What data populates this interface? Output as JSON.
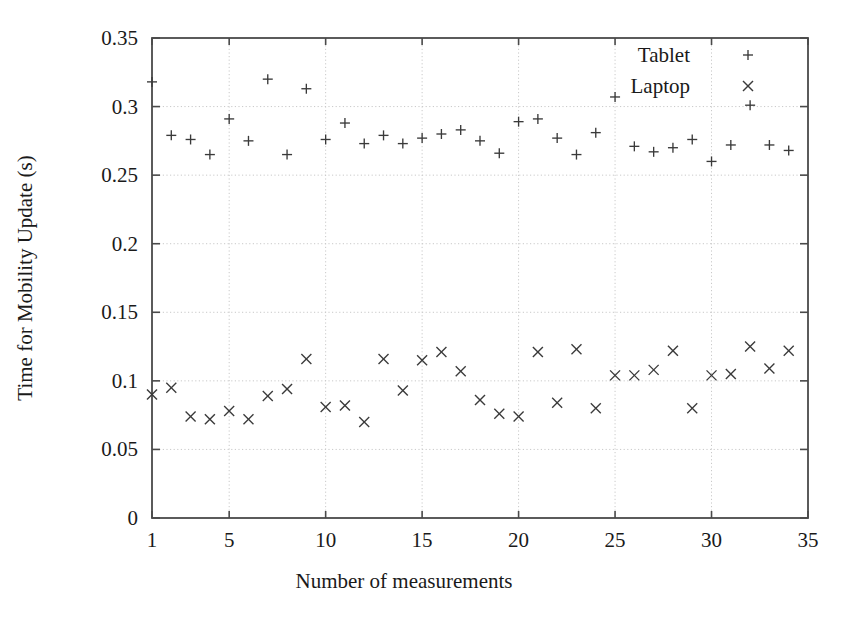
{
  "chart_data": {
    "type": "scatter",
    "title": "",
    "xlabel": "Number of measurements",
    "ylabel": "Time for Mobility Update (s)",
    "xlim": [
      1,
      35
    ],
    "ylim": [
      0,
      0.35
    ],
    "xticks": [
      1,
      5,
      10,
      15,
      20,
      25,
      30,
      35
    ],
    "xtick_labels": [
      "1",
      "5",
      "10",
      "15",
      "20",
      "25",
      "30",
      "35"
    ],
    "yticks": [
      0,
      0.05,
      0.1,
      0.15,
      0.2,
      0.25,
      0.3,
      0.35
    ],
    "ytick_labels": [
      "0",
      "0.05",
      "0.1",
      "0.15",
      "0.2",
      "0.25",
      "0.3",
      "0.35"
    ],
    "grid": true,
    "legend_position": "top-right",
    "series": [
      {
        "name": "Tablet",
        "marker": "plus",
        "color": "#3a3a3a",
        "x": [
          1,
          2,
          3,
          4,
          5,
          6,
          7,
          8,
          9,
          10,
          11,
          12,
          13,
          14,
          15,
          16,
          17,
          18,
          19,
          20,
          21,
          22,
          23,
          24,
          25,
          26,
          27,
          28,
          29,
          30,
          31,
          32,
          33,
          34
        ],
        "values": [
          0.318,
          0.279,
          0.276,
          0.265,
          0.291,
          0.275,
          0.32,
          0.265,
          0.313,
          0.276,
          0.288,
          0.273,
          0.279,
          0.273,
          0.277,
          0.28,
          0.283,
          0.275,
          0.266,
          0.289,
          0.291,
          0.277,
          0.265,
          0.281,
          0.307,
          0.271,
          0.267,
          0.27,
          0.276,
          0.26,
          0.272,
          0.301,
          0.272,
          0.268
        ]
      },
      {
        "name": "Laptop",
        "marker": "cross",
        "color": "#3a3a3a",
        "x": [
          1,
          2,
          3,
          4,
          5,
          6,
          7,
          8,
          9,
          10,
          11,
          12,
          13,
          14,
          15,
          16,
          17,
          18,
          19,
          20,
          21,
          22,
          23,
          24,
          25,
          26,
          27,
          28,
          29,
          30,
          31,
          32,
          33,
          34
        ],
        "values": [
          0.09,
          0.095,
          0.074,
          0.072,
          0.078,
          0.072,
          0.089,
          0.094,
          0.116,
          0.081,
          0.082,
          0.07,
          0.116,
          0.093,
          0.115,
          0.121,
          0.107,
          0.086,
          0.076,
          0.074,
          0.121,
          0.084,
          0.123,
          0.08,
          0.104,
          0.104,
          0.108,
          0.122,
          0.08,
          0.104,
          0.105,
          0.125,
          0.109,
          0.122
        ]
      }
    ]
  },
  "legend": {
    "entries": [
      {
        "label": "Tablet",
        "marker": "plus"
      },
      {
        "label": "Laptop",
        "marker": "cross"
      }
    ]
  }
}
